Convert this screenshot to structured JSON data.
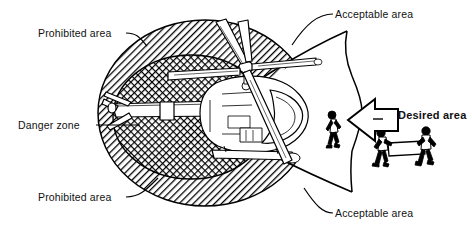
{
  "figure": {
    "background_color": "#ffffff",
    "ink_color": "#000000"
  },
  "labels": {
    "prohibited_top": "Prohibited area",
    "prohibited_bottom": "Prohibited area",
    "danger_zone": "Danger zone",
    "acceptable_top": "Acceptable area",
    "acceptable_bottom": "Acceptable area",
    "desired": "Desired area"
  },
  "zones": [
    {
      "name": "prohibited-area",
      "label": "Prohibited area",
      "fill_pattern": "diagonal-hatch",
      "description": "Hatched ring surrounding the helicopter, excluding the forward wedge"
    },
    {
      "name": "danger-zone",
      "label": "Danger zone",
      "fill_pattern": "cross-hatch-mesh",
      "description": "Dense cross-hatched ellipse around tail rotor and rear fuselage"
    },
    {
      "name": "acceptable-area",
      "label": "Acceptable area",
      "fill_pattern": "none",
      "description": "Clear wedge opening toward the right (front/side of aircraft)"
    },
    {
      "name": "desired-area",
      "label": "Desired area",
      "fill_pattern": "none",
      "description": "Approach direction indicated by the block arrow pointing left"
    }
  ],
  "figures": [
    {
      "name": "walking-person",
      "count": 1,
      "carrying": "none"
    },
    {
      "name": "carrying-crew",
      "count": 2,
      "carrying": "crate"
    }
  ],
  "aircraft": {
    "name": "helicopter",
    "view": "three-quarter top rear",
    "parts": [
      "main-rotor",
      "tail-boom",
      "tail-rotor",
      "fuselage",
      "skids",
      "cockpit"
    ]
  },
  "arrow": {
    "name": "desired-area-arrow",
    "direction": "left",
    "style": "block-arrow-outline"
  }
}
